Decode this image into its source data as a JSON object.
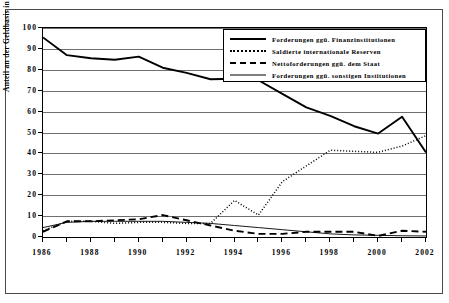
{
  "chart_data": {
    "type": "line",
    "title": "",
    "xlabel": "",
    "ylabel": "Anteil an der Geldbasis in v.H.",
    "xlim": [
      1986,
      2002
    ],
    "ylim": [
      0,
      100
    ],
    "grid": true,
    "legend_position": "top-right",
    "x": [
      1986,
      1987,
      1988,
      1989,
      1990,
      1991,
      1992,
      1993,
      1994,
      1995,
      1996,
      1997,
      1998,
      1999,
      2000,
      2001,
      2002
    ],
    "y_ticks": [
      0,
      10,
      20,
      30,
      40,
      50,
      60,
      70,
      80,
      90,
      100
    ],
    "x_ticks_labeled": [
      1986,
      1988,
      1990,
      1992,
      1994,
      1996,
      1998,
      2000,
      2002
    ],
    "series": [
      {
        "name": "Forderungen ggü. Finanzinstitutionen",
        "style": "thick-solid",
        "values": [
          95.5,
          87.0,
          85.5,
          84.8,
          86.3,
          81.0,
          78.5,
          75.5,
          75.7,
          75.0,
          68.5,
          62.0,
          58.0,
          53.0,
          49.5,
          57.5,
          40.5
        ]
      },
      {
        "name": "Saldierte internationale Reserven",
        "style": "dotted",
        "values": [
          3.0,
          7.5,
          7.5,
          6.5,
          7.0,
          7.0,
          6.5,
          6.5,
          17.5,
          10.5,
          26.5,
          34.0,
          41.5,
          41.0,
          40.5,
          43.5,
          48.5
        ]
      },
      {
        "name": "Nettoforderungen ggü. dem Staat",
        "style": "dashed",
        "values": [
          2.5,
          7.5,
          7.5,
          8.0,
          8.5,
          10.5,
          8.0,
          5.5,
          3.0,
          1.5,
          1.5,
          2.5,
          2.5,
          2.5,
          0.5,
          3.0,
          2.5
        ]
      },
      {
        "name": "Forderungen ggü. sonstigen Institutionen",
        "style": "thin-solid",
        "values": [
          4.5,
          7.0,
          7.5,
          7.5,
          7.5,
          7.5,
          7.0,
          6.5,
          5.5,
          4.5,
          3.5,
          2.5,
          1.5,
          1.0,
          0.8,
          0.6,
          0.5
        ]
      }
    ]
  },
  "legend": {
    "items": [
      {
        "label": "Forderungen ggü. Finanzinstitutionen",
        "swatch": "thick-solid-line-icon"
      },
      {
        "label": "Saldierte internationale Reserven",
        "swatch": "dotted-line-icon"
      },
      {
        "label": "Nettoforderungen ggü. dem Staat",
        "swatch": "dashed-line-icon"
      },
      {
        "label": "Forderungen ggü. sonstigen Institutionen",
        "swatch": "thin-solid-line-icon"
      }
    ]
  },
  "axes": {
    "y_title": "Anteil an der Geldbasis in v.H.",
    "y_tick_labels": [
      "100",
      "90",
      "80",
      "70",
      "60",
      "50",
      "40",
      "30",
      "20",
      "10",
      "0"
    ],
    "x_tick_labels": [
      "1986",
      "1988",
      "1990",
      "1992",
      "1994",
      "1996",
      "1998",
      "2000",
      "2002"
    ]
  }
}
